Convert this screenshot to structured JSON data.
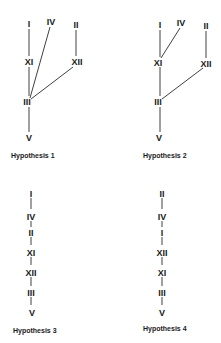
{
  "diagrams": [
    {
      "caption": "Hypothesis 1",
      "nodes": {
        "I": "I",
        "IV": "IV",
        "II": "II",
        "XI": "XI",
        "XII": "XII",
        "III": "III",
        "V": "V"
      }
    },
    {
      "caption": "Hypothesis 2",
      "nodes": {
        "I": "I",
        "IV": "IV",
        "II": "II",
        "XI": "XI",
        "XII": "XII",
        "III": "III",
        "V": "V"
      }
    },
    {
      "caption": "Hypothesis 3",
      "sequence": [
        "I",
        "IV",
        "II",
        "XI",
        "XII",
        "III",
        "V"
      ]
    },
    {
      "caption": "Hypothesis 4",
      "sequence": [
        "II",
        "IV",
        "I",
        "XII",
        "XI",
        "III",
        "V"
      ]
    }
  ]
}
